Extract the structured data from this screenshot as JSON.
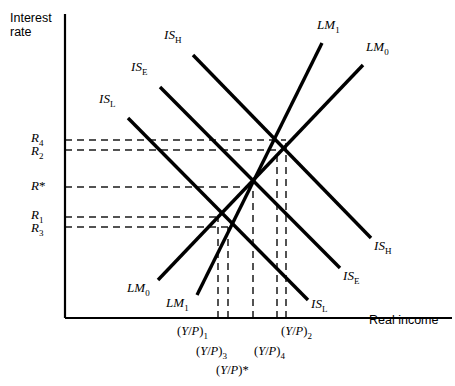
{
  "figure": {
    "type": "economics-diagram",
    "model": "IS-LM",
    "axes": {
      "y_label_line1": "Interest",
      "y_label_line2": "rate",
      "x_label": "Real income",
      "origin_px": [
        65,
        318
      ],
      "y_axis_top_px": 14,
      "x_axis_right_px": 452
    },
    "y_ticks": [
      {
        "id": "R4",
        "base": "R",
        "sub": "4",
        "star": false,
        "y_px": 140,
        "label_x": 31,
        "label_y": 131
      },
      {
        "id": "R2",
        "base": "R",
        "sub": "2",
        "star": false,
        "y_px": 150,
        "label_x": 31,
        "label_y": 144
      },
      {
        "id": "Rstar",
        "base": "R",
        "sub": "",
        "star": true,
        "y_px": 187,
        "label_x": 31,
        "label_y": 179
      },
      {
        "id": "R1",
        "base": "R",
        "sub": "1",
        "star": false,
        "y_px": 217,
        "label_x": 31,
        "label_y": 208
      },
      {
        "id": "R3",
        "base": "R",
        "sub": "3",
        "star": false,
        "y_px": 227,
        "label_x": 31,
        "label_y": 221
      }
    ],
    "x_ticks": [
      {
        "id": "YP1",
        "text": "(Y/P)",
        "sub": "1",
        "star": false,
        "x_px": 218,
        "label_x": 177,
        "label_y": 325
      },
      {
        "id": "YP3",
        "text": "(Y/P)",
        "sub": "3",
        "star": false,
        "x_px": 228,
        "label_x": 196,
        "label_y": 345
      },
      {
        "id": "YPstar",
        "text": "(Y/P)",
        "sub": "",
        "star": true,
        "x_px": 253,
        "label_x": 216,
        "label_y": 364
      },
      {
        "id": "YP4",
        "text": "(Y/P)",
        "sub": "4",
        "star": false,
        "x_px": 277,
        "label_x": 254,
        "label_y": 345
      },
      {
        "id": "YP2",
        "text": "(Y/P)",
        "sub": "2",
        "star": false,
        "x_px": 286,
        "label_x": 281,
        "label_y": 325
      }
    ],
    "curves": [
      {
        "id": "IS_H",
        "base": "IS",
        "sub": "H",
        "kind": "IS",
        "x1": 193,
        "y1": 55,
        "x2": 371,
        "y2": 238,
        "label_top_x": 164,
        "label_top_y": 28,
        "label_bottom_x": 374,
        "label_bottom_y": 239
      },
      {
        "id": "IS_E",
        "base": "IS",
        "sub": "E",
        "kind": "IS",
        "x1": 160,
        "y1": 87,
        "x2": 340,
        "y2": 268,
        "label_top_x": 131,
        "label_top_y": 60,
        "label_bottom_x": 343,
        "label_bottom_y": 269
      },
      {
        "id": "IS_L",
        "base": "IS",
        "sub": "L",
        "kind": "IS",
        "x1": 128,
        "y1": 118,
        "x2": 308,
        "y2": 300,
        "label_top_x": 99,
        "label_top_y": 92,
        "label_bottom_x": 311,
        "label_bottom_y": 297
      },
      {
        "id": "LM_1",
        "base": "LM",
        "sub": "1",
        "kind": "LM",
        "x1": 197,
        "y1": 295,
        "x2": 322,
        "y2": 43,
        "label_top_x": 317,
        "label_top_y": 18,
        "label_bottom_x": 166,
        "label_bottom_y": 296
      },
      {
        "id": "LM_0",
        "base": "LM",
        "sub": "0",
        "kind": "LM",
        "x1": 158,
        "y1": 280,
        "x2": 363,
        "y2": 65,
        "label_top_x": 366,
        "label_top_y": 40,
        "label_bottom_x": 127,
        "label_bottom_y": 281
      }
    ],
    "equilibria": [
      {
        "id": "E_star",
        "x_px": 253,
        "y_px": 187,
        "rate": "R*",
        "income": "(Y/P)*"
      },
      {
        "id": "E_1",
        "x_px": 218,
        "y_px": 217,
        "rate": "R1",
        "income": "(Y/P)1"
      },
      {
        "id": "E_2",
        "x_px": 286,
        "y_px": 140,
        "rate": "R4",
        "income": "(Y/P)2"
      },
      {
        "id": "E_3",
        "x_px": 228,
        "y_px": 227,
        "rate": "R3",
        "income": "(Y/P)3"
      },
      {
        "id": "E_4",
        "x_px": 277,
        "y_px": 150,
        "rate": "R2",
        "income": "(Y/P)4"
      }
    ],
    "style": {
      "line_color": "#000000",
      "curve_width": 3.4,
      "axis_width": 2.2,
      "dash_color": "#1a1a1a",
      "dash_width": 1.5,
      "dash_pattern": "7,5",
      "background": "#ffffff"
    }
  }
}
